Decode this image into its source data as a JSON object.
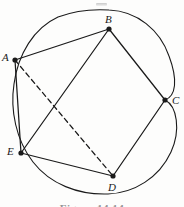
{
  "figure": {
    "type": "geometry-diagram",
    "width": 184,
    "height": 207,
    "background_color": "#fdfdfc",
    "stroke_color": "#1a1a1a",
    "caption": {
      "text": "Figure 14.14",
      "clipped": true,
      "top": 198,
      "visible_height": 9
    },
    "artifact": {
      "name": "scan-smudge",
      "x": 96,
      "y": 3,
      "width": 11,
      "height": 3
    },
    "circle": {
      "name": "circumscribed-circle",
      "stroke_width": 1.1,
      "path": "M 109 10 C 137 11 160 30 169 56 C 178 80 176 96 165 100 C 177 106 181 130 171 152 C 159 178 134 193 108 194 C 78 195 50 184 33 162 C 16 140 10 110 14 84 C 18 54 34 28 58 17 C 74 11 93 9 109 10 Z"
    },
    "vertices": [
      {
        "id": "A",
        "label": "A",
        "x": 15,
        "y": 60,
        "label_x": 2,
        "label_y": 52,
        "dot_r": 2.6
      },
      {
        "id": "B",
        "label": "B",
        "x": 109,
        "y": 29,
        "label_x": 105,
        "label_y": 14,
        "dot_r": 2.6
      },
      {
        "id": "C",
        "label": "C",
        "x": 165,
        "y": 100,
        "label_x": 172,
        "label_y": 95,
        "dot_r": 2.6
      },
      {
        "id": "D",
        "label": "D",
        "x": 113,
        "y": 176,
        "label_x": 108,
        "label_y": 182,
        "dot_r": 2.6
      },
      {
        "id": "E",
        "label": "E",
        "x": 21,
        "y": 153,
        "label_x": 7,
        "label_y": 146,
        "dot_r": 2.6
      }
    ],
    "edges": [
      {
        "name": "edge-A-B",
        "from": "A",
        "to": "B",
        "style": "solid",
        "x1": 15,
        "y1": 60,
        "x2": 109,
        "y2": 29
      },
      {
        "name": "edge-B-C",
        "from": "B",
        "to": "C",
        "style": "solid",
        "x1": 109,
        "y1": 29,
        "x2": 165,
        "y2": 100
      },
      {
        "name": "edge-C-D",
        "from": "C",
        "to": "D",
        "style": "solid",
        "x1": 165,
        "y1": 100,
        "x2": 113,
        "y2": 176
      },
      {
        "name": "edge-D-E",
        "from": "D",
        "to": "E",
        "style": "solid",
        "x1": 113,
        "y1": 176,
        "x2": 21,
        "y2": 153
      },
      {
        "name": "edge-E-A",
        "from": "E",
        "to": "A",
        "style": "solid",
        "x1": 21,
        "y1": 153,
        "x2": 15,
        "y2": 60
      }
    ],
    "diagonals": [
      {
        "name": "diagonal-B-E",
        "from": "B",
        "to": "E",
        "style": "solid",
        "x1": 109,
        "y1": 29,
        "x2": 21,
        "y2": 153
      },
      {
        "name": "diagonal-A-D",
        "from": "A",
        "to": "D",
        "style": "dashed",
        "x1": 15,
        "y1": 60,
        "x2": 113,
        "y2": 176,
        "dash_pattern": "5,3.5"
      }
    ]
  }
}
